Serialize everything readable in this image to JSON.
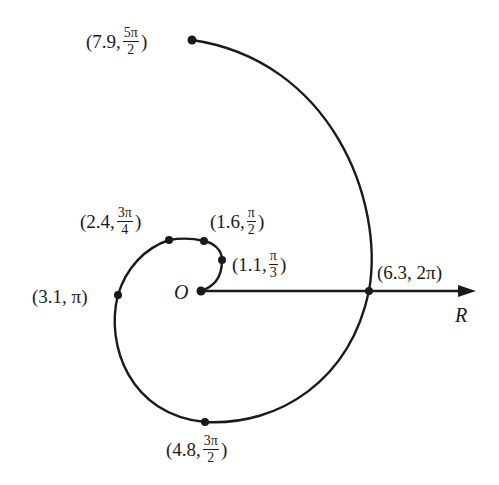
{
  "diagram": {
    "title": "",
    "origin_label": "O",
    "axis_label": "R",
    "points": [
      {
        "id": "p1",
        "r": "1.1",
        "theta_num": "π",
        "theta_den": "3",
        "prefix": "(1.1, ",
        "suffix": ")"
      },
      {
        "id": "p2",
        "r": "1.6",
        "theta_num": "π",
        "theta_den": "2",
        "prefix": "(1.6, ",
        "suffix": ")"
      },
      {
        "id": "p3",
        "r": "2.4",
        "theta_num": "3π",
        "theta_den": "4",
        "prefix": "(2.4, ",
        "suffix": ")"
      },
      {
        "id": "p4",
        "r": "3.1",
        "theta": "π",
        "text": "(3.1, π)"
      },
      {
        "id": "p5",
        "r": "4.8",
        "theta_num": "3π",
        "theta_den": "2",
        "prefix": "(4.8, ",
        "suffix": ")"
      },
      {
        "id": "p6",
        "r": "6.3",
        "theta": "2π",
        "text": "(6.3, 2π)"
      },
      {
        "id": "p7",
        "r": "7.9",
        "theta_num": "5π",
        "theta_den": "2",
        "prefix": "(7.9, ",
        "suffix": ")"
      }
    ],
    "colors": {
      "stroke": "#1a1a1a",
      "background": "#ffffff"
    }
  }
}
